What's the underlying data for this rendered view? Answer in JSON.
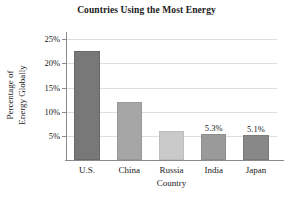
{
  "chart_data": {
    "type": "bar",
    "title": "Countries Using the Most Energy",
    "xlabel": "Country",
    "ylabel_lines": [
      "Percentage of",
      "Energy Globally"
    ],
    "ylabel": "Percentage of Energy Globally",
    "categories": [
      "U.S.",
      "China",
      "Russia",
      "India",
      "Japan"
    ],
    "values": [
      22.5,
      12.0,
      6.1,
      5.3,
      5.1
    ],
    "point_labels": [
      "",
      "",
      "",
      "5.3%",
      "5.1%"
    ],
    "bar_colors": [
      "#787878",
      "#a6a6a6",
      "#c9c9c9",
      "#9a9a9a",
      "#888888"
    ],
    "bar_edge_colors": [
      "#6a6a6a",
      "#999999",
      "#bdbdbd",
      "#8d8d8d",
      "#7b7b7b"
    ],
    "ylim": [
      0,
      26.5
    ],
    "yticks": [
      5,
      10,
      15,
      20,
      25
    ],
    "ytick_labels": [
      "5%",
      "10%",
      "15%",
      "20%",
      "25%"
    ],
    "grid": true,
    "grid_color": "#dedede",
    "legend": "none",
    "axis_color": "#8a8a8a",
    "text_color": "#1a1a1a",
    "background": "#ffffff"
  }
}
